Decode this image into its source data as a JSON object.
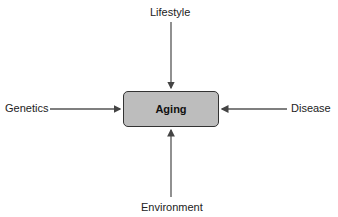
{
  "diagram": {
    "center": {
      "label": "Aging",
      "fill": "#bdbdbd"
    },
    "factors": {
      "top": "Lifestyle",
      "left": "Genetics",
      "right": "Disease",
      "bottom": "Environment"
    },
    "arrow_color": "#555555"
  }
}
